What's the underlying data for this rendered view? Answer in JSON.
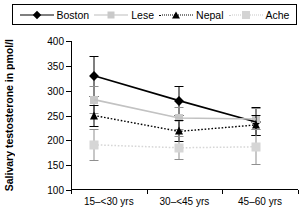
{
  "legend": {
    "items": [
      {
        "label": "Boston",
        "style": "solid-black",
        "marker": "diamond",
        "color": "#000000"
      },
      {
        "label": "Lese",
        "style": "solid-gray",
        "marker": "square",
        "color": "#c9c9c9"
      },
      {
        "label": "Nepal",
        "style": "dot-black",
        "marker": "triangle",
        "color": "#000000"
      },
      {
        "label": "Ache",
        "style": "dot-gray",
        "marker": "square-light",
        "color": "#d6d6d6"
      }
    ]
  },
  "chart_data": {
    "type": "line",
    "title": "",
    "xlabel": "",
    "ylabel": "Salivary testosterone in pmol/l",
    "categories": [
      "15–<30 yrs",
      "30–<45 yrs",
      "45–60 yrs"
    ],
    "ylim": [
      100,
      400
    ],
    "yticks": [
      100,
      150,
      200,
      250,
      300,
      350,
      400
    ],
    "grid": false,
    "legend_position": "top",
    "error_bars": true,
    "series": [
      {
        "name": "Boston",
        "values": [
          330,
          280,
          237
        ],
        "err_low": [
          290,
          252,
          210
        ],
        "err_high": [
          370,
          310,
          268
        ]
      },
      {
        "name": "Lese",
        "values": [
          282,
          245,
          243
        ],
        "err_low": [
          255,
          222,
          222
        ],
        "err_high": [
          310,
          268,
          265
        ]
      },
      {
        "name": "Nepal",
        "values": [
          250,
          218,
          231
        ],
        "err_low": [
          228,
          198,
          210
        ],
        "err_high": [
          272,
          240,
          252
        ]
      },
      {
        "name": "Ache",
        "values": [
          191,
          185,
          187
        ],
        "err_low": [
          160,
          163,
          152
        ],
        "err_high": [
          222,
          208,
          222
        ]
      }
    ]
  }
}
